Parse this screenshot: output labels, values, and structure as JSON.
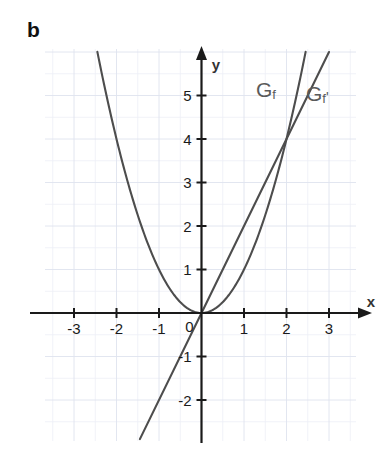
{
  "figure": {
    "panel_letter": "b",
    "background_color": "#ffffff",
    "grid_color": "#e3e6ef",
    "axis_color": "#1a1a1a",
    "curve_color": "#4d4d4d",
    "label_color": "#5a5a5a"
  },
  "labels": {
    "gf": {
      "base": "G",
      "sub": "f",
      "prime": ""
    },
    "gfprime": {
      "base": "G",
      "sub": "f",
      "prime": "'"
    }
  },
  "chart_data": {
    "type": "line",
    "title": "",
    "xlabel": "x",
    "ylabel": "y",
    "xlim": [
      -3.7,
      3.6
    ],
    "ylim": [
      -2.9,
      6.1
    ],
    "grid": true,
    "grid_step": 0.5,
    "legend_position": "inline-curve-labels",
    "xticks": [
      -3,
      -2,
      -1,
      0,
      1,
      2,
      3
    ],
    "xticklabels": [
      "-3",
      "-2",
      "-1",
      "0",
      "1",
      "2",
      "3"
    ],
    "yticks": [
      -2,
      -1,
      1,
      2,
      3,
      4,
      5
    ],
    "yticklabels": [
      "-2",
      "-1",
      "1",
      "2",
      "3",
      "4",
      "5"
    ],
    "origin_label": "0",
    "annotations": [
      {
        "text": "Gf",
        "x": 1.3,
        "y": 5.0
      },
      {
        "text": "Gf'",
        "x": 2.5,
        "y": 4.9
      }
    ],
    "series": [
      {
        "name": "Gf",
        "kind": "parabola",
        "equation": "y = x^2",
        "color": "#4d4d4d",
        "x": [
          -2.45,
          -2.2,
          -2.0,
          -1.75,
          -1.5,
          -1.25,
          -1.0,
          -0.75,
          -0.5,
          -0.25,
          0,
          0.25,
          0.5,
          0.75,
          1.0,
          1.25,
          1.5,
          1.75,
          2.0,
          2.25,
          2.45
        ],
        "values": [
          6.0,
          4.84,
          4.0,
          3.06,
          2.25,
          1.56,
          1.0,
          0.56,
          0.25,
          0.06,
          0,
          0.06,
          0.25,
          0.56,
          1.0,
          1.56,
          2.25,
          3.06,
          4.0,
          5.06,
          6.0
        ]
      },
      {
        "name": "Gf'",
        "kind": "line",
        "equation": "y = 2x",
        "color": "#4d4d4d",
        "slope": 2,
        "intercept": 0,
        "x": [
          -1.45,
          0,
          3.0
        ],
        "values": [
          -2.9,
          0,
          6.0
        ]
      }
    ],
    "intersections": [
      {
        "x": 0,
        "y": 0
      },
      {
        "x": 2,
        "y": 4
      }
    ]
  }
}
